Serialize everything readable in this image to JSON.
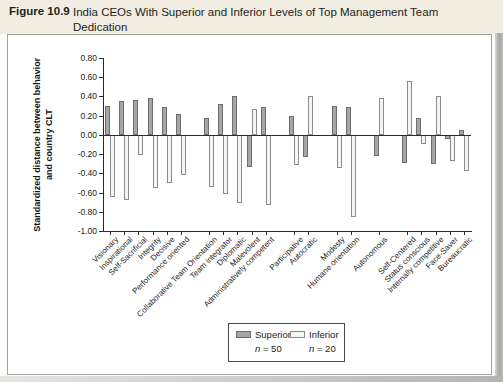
{
  "figure": {
    "label": "Figure 10.9",
    "title": "India CEOs With Superior and Inferior Levels of Top Management Team Dedication"
  },
  "chart_data": {
    "type": "bar",
    "title": "India CEOs With Superior and Inferior Levels of Top Management Team Dedication",
    "xlabel": "",
    "ylabel": "Standardized distance between behavior and country CLT",
    "ylabel_lines": [
      "Standardized distance between behavior",
      "and country CLT"
    ],
    "ylim": [
      -1.0,
      0.8
    ],
    "ytick_step": 0.2,
    "yticks": [
      "0.80",
      "0.60",
      "0.40",
      "0.20",
      "0.00",
      "-0.20",
      "-0.40",
      "-0.60",
      "-0.80",
      "-1.00"
    ],
    "grid": false,
    "legend_position": "bottom",
    "categories": [
      "Visionary",
      "Inspirational",
      "Self-Sacrificial",
      "Integrity",
      "Decisive",
      "Performance oriented",
      "Collaborative Team Orientation",
      "Team integrator",
      "Diplomatic",
      "Malevolent",
      "Administratively competent",
      "Participative",
      "Autocratic",
      "Modesty",
      "Humane orientation",
      "Autonomous",
      "Self-Centered",
      "Status conscious",
      "Internally competitive",
      "Face-Saver",
      "Bureaucratic"
    ],
    "groups": [
      0,
      0,
      0,
      0,
      0,
      0,
      1,
      1,
      1,
      1,
      1,
      2,
      2,
      3,
      3,
      4,
      5,
      5,
      5,
      5,
      5
    ],
    "series": [
      {
        "name": "Superior",
        "n_label": "n = 50",
        "color": "#a6a6a3",
        "stroke": "#6e6e6c",
        "values": [
          0.3,
          0.35,
          0.36,
          0.38,
          0.29,
          0.22,
          0.18,
          0.32,
          0.4,
          -0.33,
          0.29,
          0.2,
          -0.23,
          0.3,
          0.29,
          -0.22,
          -0.29,
          0.18,
          -0.3,
          -0.04,
          0.05
        ]
      },
      {
        "name": "Inferior",
        "n_label": "n = 20",
        "color": "#f5f5f2",
        "stroke": "#8c8c8a",
        "values": [
          -0.65,
          -0.68,
          -0.21,
          -0.55,
          -0.5,
          -0.42,
          -0.54,
          -0.62,
          -0.71,
          0.27,
          -0.73,
          -0.31,
          0.4,
          -0.34,
          -0.85,
          0.38,
          0.56,
          -0.1,
          0.4,
          -0.27,
          -0.38
        ]
      }
    ],
    "axis_color": "#2a2a2a"
  }
}
